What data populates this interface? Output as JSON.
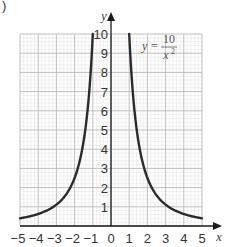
{
  "figure": {
    "part_label": ")"
  },
  "chart_data": {
    "type": "line",
    "title": "",
    "equation": {
      "lhs": "y",
      "equals": "=",
      "numerator": "10",
      "denominator_var": "x",
      "denominator_exp": "2"
    },
    "function": "y = 10 / x^2",
    "xlabel": "x",
    "ylabel": "y",
    "xlim": [
      -5,
      5
    ],
    "ylim": [
      0,
      10
    ],
    "grid": true,
    "grid_minor_subdivisions": 5,
    "x_ticks": [
      "-5",
      "-4",
      "-3",
      "-2",
      "-1",
      "0",
      "1",
      "2",
      "3",
      "4",
      "5"
    ],
    "y_ticks": [
      "1",
      "2",
      "3",
      "4",
      "5",
      "6",
      "7",
      "8",
      "9",
      "10"
    ],
    "series": [
      {
        "name": "y = 10/x^2 (x < 0)",
        "x": [
          -5,
          -4.5,
          -4,
          -3.5,
          -3,
          -2.5,
          -2,
          -1.75,
          -1.5,
          -1.25,
          -1.1,
          -1
        ],
        "y": [
          0.4,
          0.49,
          0.625,
          0.82,
          1.11,
          1.6,
          2.5,
          3.27,
          4.44,
          6.4,
          8.26,
          10
        ]
      },
      {
        "name": "y = 10/x^2 (x > 0)",
        "x": [
          1,
          1.1,
          1.25,
          1.5,
          1.75,
          2,
          2.5,
          3,
          3.5,
          4,
          4.5,
          5
        ],
        "y": [
          10,
          8.26,
          6.4,
          4.44,
          3.27,
          2.5,
          1.6,
          1.11,
          0.82,
          0.625,
          0.49,
          0.4
        ]
      }
    ],
    "colors": {
      "curve": "#2b2b2b",
      "axis": "#1a1a1a",
      "grid_major": "#b8b8b8",
      "grid_minor": "#e2e2e2",
      "text": "#333333"
    }
  }
}
